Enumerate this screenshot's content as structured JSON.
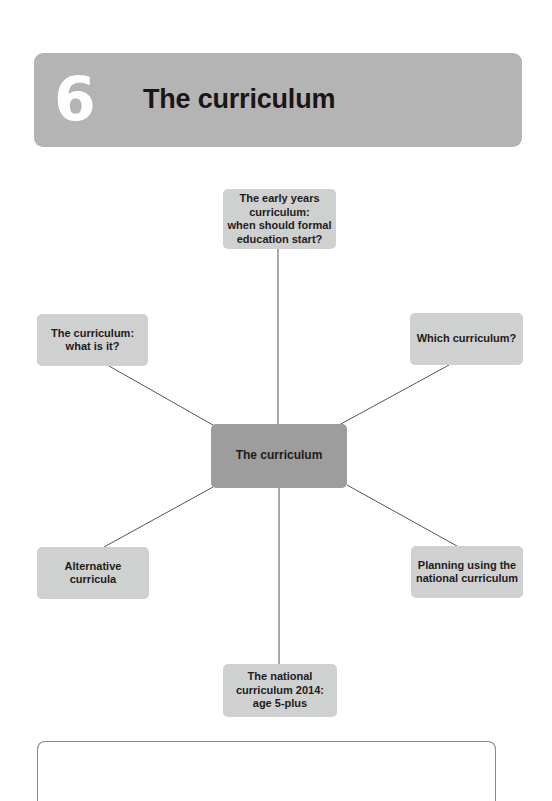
{
  "header": {
    "chapter_number": "6",
    "title": "The curriculum",
    "background_color": "#b4b4b4"
  },
  "diagram": {
    "center": {
      "label": "The curriculum",
      "color": "#9d9d9d"
    },
    "nodes": [
      {
        "id": "top",
        "lines": [
          "The early years",
          "curriculum:",
          "when should formal",
          "education start?"
        ]
      },
      {
        "id": "top-left",
        "lines": [
          "The curriculum:",
          "what is it?"
        ]
      },
      {
        "id": "top-right",
        "lines": [
          "Which curriculum?"
        ]
      },
      {
        "id": "bottom-left",
        "lines": [
          "Alternative",
          "curricula"
        ]
      },
      {
        "id": "bottom-right",
        "lines": [
          "Planning using the",
          "national curriculum"
        ]
      },
      {
        "id": "bottom",
        "lines": [
          "The national",
          "curriculum 2014:",
          "age 5-plus"
        ]
      }
    ],
    "node_color": "#cfd1d1",
    "line_color": "#555555"
  }
}
